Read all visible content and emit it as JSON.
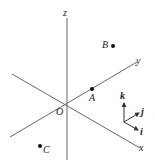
{
  "diagram": {
    "type": "3d-coordinate-axes",
    "axes": {
      "x_label": "x",
      "y_label": "y",
      "z_label": "z",
      "origin_label": "O"
    },
    "points": [
      {
        "label": "A"
      },
      {
        "label": "B"
      },
      {
        "label": "C"
      }
    ],
    "unit_vectors": {
      "i_label": "i",
      "j_label": "j",
      "k_label": "k"
    },
    "colors": {
      "line": "#555555",
      "text": "#222222",
      "point": "#111111"
    }
  }
}
